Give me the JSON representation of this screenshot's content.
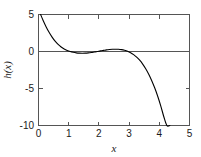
{
  "chart_data": {
    "type": "line",
    "title": "",
    "subtitle": "",
    "xlabel": "x",
    "ylabel": "h(x)",
    "xlim": [
      0,
      5
    ],
    "ylim": [
      -10,
      5
    ],
    "grid": false,
    "legend": null,
    "legend_position": "none",
    "xticks": [
      0,
      1,
      2,
      3,
      4,
      5
    ],
    "xtick_labels": [
      "0",
      "1",
      "2",
      "3",
      "4",
      "5"
    ],
    "yticks": [
      5,
      0,
      -5,
      -10
    ],
    "ytick_labels": [
      "5",
      "0",
      "-5",
      "-10"
    ],
    "zero_line": 0,
    "annotations": [],
    "series": [
      {
        "name": "h(x)",
        "color": "#000000",
        "x": [
          0.07,
          0.15,
          0.25,
          0.35,
          0.45,
          0.55,
          0.65,
          0.75,
          0.85,
          0.95,
          1.05,
          1.15,
          1.25,
          1.35,
          1.45,
          1.55,
          1.65,
          1.75,
          1.85,
          1.95,
          2.05,
          2.15,
          2.25,
          2.35,
          2.45,
          2.55,
          2.65,
          2.75,
          2.85,
          2.95,
          3.05,
          3.15,
          3.25,
          3.35,
          3.45,
          3.55,
          3.65,
          3.75,
          3.85,
          3.95,
          4.05,
          4.15,
          4.25,
          4.35
        ],
        "y": [
          5.0,
          4.23,
          3.36,
          2.6,
          1.95,
          1.4,
          0.95,
          0.6,
          0.33,
          0.13,
          -0.01,
          -0.11,
          -0.18,
          -0.22,
          -0.23,
          -0.22,
          -0.19,
          -0.14,
          -0.07,
          0.0,
          0.08,
          0.15,
          0.22,
          0.27,
          0.3,
          0.31,
          0.3,
          0.25,
          0.16,
          0.03,
          -0.16,
          -0.42,
          -0.76,
          -1.18,
          -1.7,
          -2.33,
          -3.07,
          -3.94,
          -4.94,
          -6.08,
          -7.37,
          -8.82,
          -10.0,
          -10.0
        ]
      }
    ]
  },
  "axes": {
    "x_axis_name": "x-axis",
    "y_axis_name": "y-axis",
    "frame": "box"
  }
}
